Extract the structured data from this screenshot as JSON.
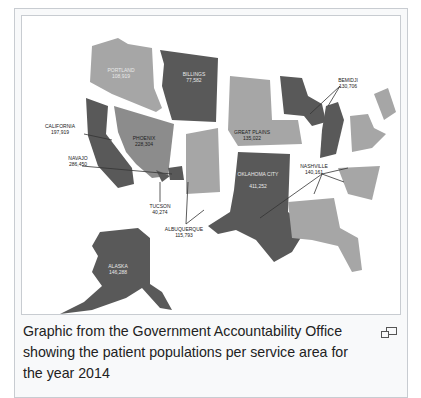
{
  "figure": {
    "caption": "Graphic from the Government Accountability Office showing the patient populations per service area for the year 2014",
    "enlarge_icon": "magnify-clip-icon"
  },
  "map": {
    "title": "Patient populations per IHS service area, 2014",
    "colors": {
      "dark": "#595959",
      "medium": "#8c8c8c",
      "light": "#a6a6a6",
      "border": "#c8ccd1",
      "caption_bg": "#f8f9fa"
    },
    "areas": [
      {
        "name": "PORTLAND",
        "population": "108,919"
      },
      {
        "name": "BILLINGS",
        "population": "77,582"
      },
      {
        "name": "CALIFORNIA",
        "population": "197,919"
      },
      {
        "name": "NAVAJO",
        "population": "286,450"
      },
      {
        "name": "PHOENIX",
        "population": "228,304"
      },
      {
        "name": "GREAT PLAINS",
        "population": "135,022"
      },
      {
        "name": "BEMIDJI",
        "population": "130,706"
      },
      {
        "name": "OKLAHOMA CITY",
        "population": "411,252"
      },
      {
        "name": "NASHVILLE",
        "population": "140,161"
      },
      {
        "name": "TUCSON",
        "population": "40,274"
      },
      {
        "name": "ALBUQUERQUE",
        "population": "115,793"
      },
      {
        "name": "ALASKA",
        "population": "146,288"
      }
    ]
  }
}
